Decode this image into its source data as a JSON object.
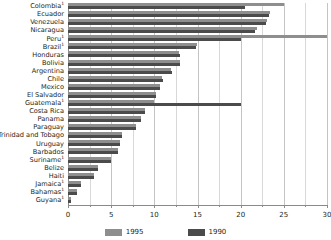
{
  "chart_data": {
    "type": "bar",
    "orientation": "horizontal",
    "title": "",
    "subtitle": "",
    "xlabel": "",
    "ylabel": "",
    "xlim": [
      0,
      30
    ],
    "xticks": [
      0,
      5,
      10,
      15,
      20,
      25,
      30
    ],
    "xtick_labels": [
      "0",
      "5",
      "10",
      "15",
      "20",
      "25",
      "30"
    ],
    "grid": true,
    "grid_axis": "x",
    "legend_position": "bottom",
    "categories": [
      "Colombia",
      "Ecuador",
      "Venezuela",
      "Nicaragua",
      "Peru",
      "Brazil",
      "Honduras",
      "Bolivia",
      "Argentina",
      "Chile",
      "Mexico",
      "El Salvador",
      "Guatemala",
      "Costa Rica",
      "Panama",
      "Paraguay",
      "Trinidad and Tobago",
      "Uruguay",
      "Barbados",
      "Suriname",
      "Belize",
      "Haiti",
      "Jamaica",
      "Bahamas",
      "Guyana"
    ],
    "category_footnotes": {
      "Colombia": "1",
      "Peru": "1",
      "Brazil": "1",
      "Guatemala": "1",
      "Suriname": "1",
      "Jamaica": "1",
      "Bahamas": "1",
      "Guyana": "1"
    },
    "series": [
      {
        "name": "1995",
        "color": "#8e8e8e",
        "values": [
          25.0,
          23.4,
          23.0,
          21.9,
          30.0,
          14.9,
          12.9,
          13.0,
          11.9,
          10.9,
          10.6,
          10.2,
          10.0,
          8.9,
          8.4,
          7.9,
          6.2,
          6.0,
          5.8,
          5.0,
          3.5,
          3.0,
          1.5,
          1.0,
          0.3
        ]
      },
      {
        "name": "1990",
        "color": "#4b4b4b",
        "values": [
          20.5,
          23.3,
          22.9,
          21.7,
          20.0,
          14.8,
          13.0,
          13.0,
          12.0,
          11.0,
          10.6,
          10.2,
          20.0,
          8.9,
          8.4,
          7.9,
          6.2,
          6.0,
          5.8,
          5.0,
          3.5,
          3.0,
          1.5,
          1.0,
          0.3
        ]
      }
    ]
  },
  "legend": {
    "items": [
      {
        "label": "1995",
        "color": "#8e8e8e"
      },
      {
        "label": "1990",
        "color": "#4b4b4b"
      }
    ]
  }
}
